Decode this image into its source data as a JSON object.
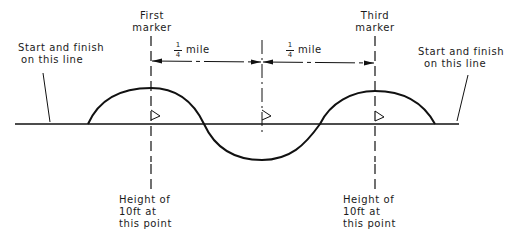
{
  "diagram": {
    "type": "course-layout",
    "labels": {
      "start_left": [
        "Start and finish",
        "on this line"
      ],
      "start_right": [
        "Start and finish",
        "on this line"
      ],
      "first_marker": [
        "First",
        "marker"
      ],
      "third_marker": [
        "Third",
        "marker"
      ],
      "height_left": [
        "Height of",
        "10ft at",
        "this point"
      ],
      "height_right": [
        "Height of",
        "10ft at",
        "this point"
      ]
    },
    "dimensions": [
      {
        "numerator": "1",
        "denominator": "4",
        "unit": "mile"
      },
      {
        "numerator": "1",
        "denominator": "4",
        "unit": "mile"
      }
    ],
    "colors": {
      "line": "#111111",
      "background": "#ffffff"
    }
  }
}
